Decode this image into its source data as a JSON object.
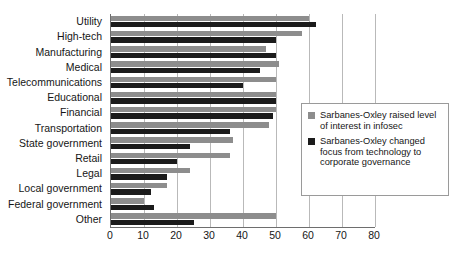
{
  "chart_data": {
    "type": "bar",
    "orientation": "horizontal",
    "title": "",
    "xlabel": "",
    "ylabel": "",
    "xlim": [
      0,
      80
    ],
    "xticks": [
      0,
      10,
      20,
      30,
      40,
      50,
      60,
      70,
      80
    ],
    "grid": "vertical",
    "legend_position": "inside-right",
    "categories": [
      "Utility",
      "High-tech",
      "Manufacturing",
      "Medical",
      "Telecommunications",
      "Educational",
      "Financial",
      "Transportation",
      "State government",
      "Retail",
      "Legal",
      "Local government",
      "Federal government",
      "Other"
    ],
    "series": [
      {
        "name": "Sarbanes-Oxley raised level of interest in infosec",
        "color": "#8d8d8d",
        "values": [
          60,
          58,
          47,
          51,
          50,
          50,
          50,
          48,
          37,
          36,
          24,
          17,
          10,
          50
        ]
      },
      {
        "name": "Sarbanes-Oxley changed focus from technology to corporate governance",
        "color": "#1b1b1b",
        "values": [
          62,
          50,
          50,
          45,
          40,
          50,
          49,
          36,
          24,
          20,
          17,
          12,
          13,
          25
        ]
      }
    ]
  },
  "legend": {
    "entries": [
      {
        "swatch": "gray",
        "text": "Sarbanes-Oxley raised level of interest in infosec"
      },
      {
        "swatch": "black",
        "text": "Sarbanes-Oxley changed focus from technology to corporate governance"
      }
    ]
  },
  "colors": {
    "series_gray": "#8d8d8d",
    "series_black": "#1b1b1b",
    "gridline": "#b9b9b9",
    "axis": "#6e6e6e",
    "text": "#161616",
    "background": "#ffffff"
  }
}
